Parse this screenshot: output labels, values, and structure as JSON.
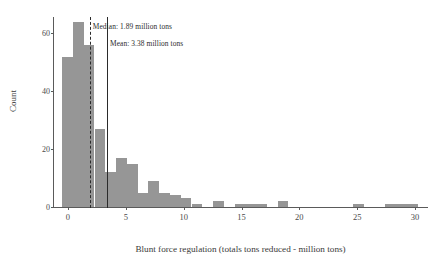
{
  "chart_data": {
    "type": "bar",
    "title": "",
    "subtitle": "",
    "xlabel": "Blunt force regulation (totals tons reduced - million tons)",
    "ylabel": "Count",
    "xlim": [
      -1.2,
      31.2
    ],
    "ylim": [
      0,
      66
    ],
    "xticks": [
      0,
      5,
      10,
      15,
      20,
      25,
      30
    ],
    "yticks": [
      0,
      20,
      40,
      60
    ],
    "grid": false,
    "legend": null,
    "bar_color": "#969696",
    "bin_width": 0.93,
    "bin_starts": [
      -0.5,
      0.43,
      1.36,
      2.3,
      3.23,
      4.16,
      5.09,
      6.02,
      6.95,
      7.88,
      8.82,
      9.75,
      10.68,
      11.61,
      12.54,
      13.47,
      14.4,
      15.34,
      16.27,
      17.2,
      18.13,
      19.06,
      24.64,
      27.43,
      28.36,
      29.29
    ],
    "values": [
      52,
      64,
      56,
      27,
      12,
      17,
      15,
      5,
      9,
      5,
      4,
      3,
      1,
      0,
      2,
      0,
      1,
      1,
      1,
      0,
      2,
      0,
      1,
      1,
      1,
      1
    ],
    "annotations": [
      {
        "name": "median",
        "label": "Median: 1.89 million tons",
        "value": 1.89,
        "line_style": "dashed",
        "color": "#2b2b2b"
      },
      {
        "name": "mean",
        "label": "Mean: 3.38 million tons",
        "value": 3.38,
        "line_style": "solid",
        "color": "#2b2b2b"
      }
    ]
  }
}
